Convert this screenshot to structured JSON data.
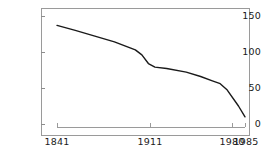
{
  "chart_data": {
    "type": "line",
    "title": "",
    "subtitle": "",
    "xlabel": "",
    "ylabel": "",
    "xlim": [
      1841,
      1985
    ],
    "ylim": [
      0,
      150
    ],
    "grid": false,
    "legend": null,
    "y_ticks": [
      0,
      50,
      100,
      150
    ],
    "y_tick_labels": [
      "0",
      "50",
      "100",
      "150"
    ],
    "x_ticks": [
      1841,
      1911,
      1980,
      1985
    ],
    "x_tick_labels": [
      "1841",
      "1911",
      "1980",
      "1985"
    ],
    "line_color": "#1a1a1a",
    "series": [
      {
        "name": "series-1",
        "x": [
          1841,
          1855,
          1870,
          1885,
          1895,
          1901,
          1906,
          1911,
          1916,
          1925,
          1940,
          1951,
          1960,
          1966,
          1971,
          1980,
          1985
        ],
        "values": [
          137,
          130,
          122,
          114,
          107,
          103,
          96,
          84,
          79,
          77,
          72,
          66,
          60,
          56,
          48,
          25,
          10
        ]
      }
    ]
  },
  "axis": {
    "y_labels": [
      "150",
      "100",
      "50",
      "0"
    ],
    "x_labels": [
      "1841",
      "1911",
      "1980",
      "1985"
    ]
  }
}
